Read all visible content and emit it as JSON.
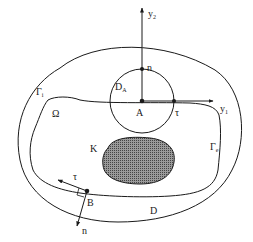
{
  "diagram": {
    "colors": {
      "stroke": "#1a1a1a",
      "background": "#ffffff",
      "hatch": "#555555"
    },
    "labels": {
      "y2_main": "y",
      "y2_sub": "2",
      "y1_main": "y",
      "y1_sub": "1",
      "n_top": "n",
      "DA_main": "D",
      "DA_sub": "A",
      "A": "A",
      "tau_right": "τ",
      "Gamma_i_main": "Γ",
      "Gamma_i_sub": "i",
      "Omega": "Ω",
      "K": "K",
      "Gamma_e_main": "Γ",
      "Gamma_e_sub": "e",
      "tau_left": "τ",
      "B": "B",
      "D": "D",
      "n_bottom": "n"
    }
  }
}
